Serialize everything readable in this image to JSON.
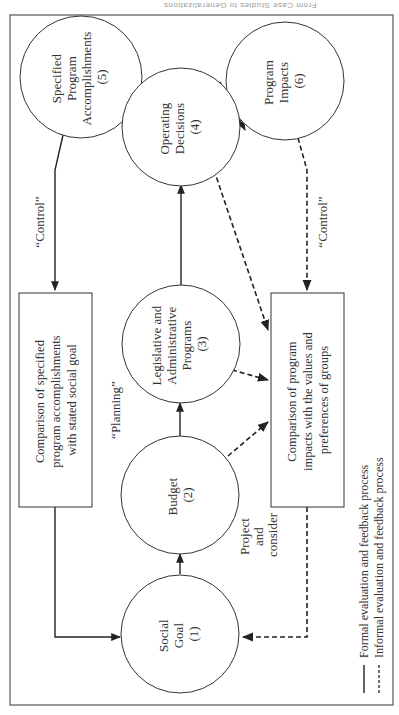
{
  "running_head": "From Case Studies to Generalizations",
  "nodes": {
    "n1": {
      "lines": [
        "Social",
        "Goal",
        "(1)"
      ]
    },
    "n2": {
      "lines": [
        "Budget",
        "(2)"
      ]
    },
    "n3": {
      "lines": [
        "Legislative and",
        "Administrative",
        "Programs",
        "(3)"
      ]
    },
    "n4": {
      "lines": [
        "Operating",
        "Decisions",
        "(4)"
      ]
    },
    "n5": {
      "lines": [
        "Specified",
        "Program",
        "Accomplishments",
        "(5)"
      ]
    },
    "n6": {
      "lines": [
        "Program",
        "Impacts",
        "(6)"
      ]
    }
  },
  "boxes": {
    "formal": {
      "lines": [
        "Comparison of specified",
        "program accomplishments",
        "with stated social goal"
      ]
    },
    "informal": {
      "lines": [
        "Comparison of program",
        "impacts with the values and",
        "preferences of groups"
      ]
    }
  },
  "labels": {
    "control_formal": "“Control”",
    "control_informal": "“Control”",
    "planning": "“Planning”",
    "project": [
      "Project",
      "and",
      "consider"
    ]
  },
  "legend": {
    "formal": "Formal evaluation and feedback process",
    "informal": "Informal evaluation and feedback process"
  },
  "colors": {
    "line": "#222222",
    "text": "#333333"
  }
}
